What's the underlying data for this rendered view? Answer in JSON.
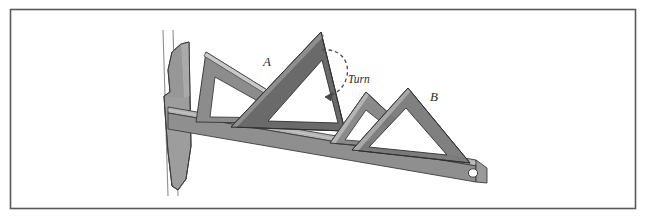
{
  "figure": {
    "background_color": "#ffffff",
    "border_color": "#595959",
    "labels": {
      "triangle_a": "A",
      "triangle_b": "B",
      "turn": "Turn"
    },
    "colors": {
      "triangle_dark": "#6e6e6e",
      "triangle_mid": "#8c8c8c",
      "triangle_light": "#a6a6a6",
      "triangle_darkest": "#5a5a5a",
      "tsquare_blade_top": "#b0b0b0",
      "tsquare_blade_body": "#8f8f8f",
      "tsquare_blade_edge": "#6b6b6b",
      "tsquare_head": "#9a9a9a",
      "board_edge_line": "#8a8a8a",
      "outline": "#3d3d3d",
      "cutout": "#ffffff"
    },
    "parts": {
      "board_edge": "board-edge-lines",
      "tsquare_head": "tsquare-head",
      "tsquare_blade": "tsquare-blade",
      "blade_hole": "blade-end-hole",
      "triangle_a_start": "triangle-a-position-1",
      "triangle_a_end": "triangle-a-position-2",
      "triangle_b_start": "triangle-b-position-1",
      "triangle_b_end": "triangle-b-position-2",
      "turn_arrow": "turn-arrow-arc"
    }
  }
}
